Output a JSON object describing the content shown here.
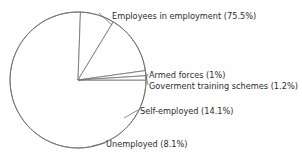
{
  "chart_data": {
    "type": "pie",
    "title": "",
    "subtitle": "",
    "xlabel": "",
    "ylabel": "",
    "legend_position": "none",
    "grid": false,
    "label_format": "{name} ({value}%)",
    "categories": [
      "Employees in employment",
      "Armed forces",
      "Goverment training schemes",
      "Self-employed",
      "Unemployed"
    ],
    "values": [
      75.5,
      1,
      1.2,
      14.1,
      8.1
    ],
    "value_labels": [
      "75.5%",
      "1%",
      "1.2%",
      "14.1%",
      "8.1%"
    ],
    "slices": [
      {
        "name": "Employees in employment",
        "value": 75.5,
        "label": "Employees in employment (75.5%)",
        "fill": "#ffffff",
        "stroke": "#6e6e6e"
      },
      {
        "name": "Armed forces",
        "value": 1,
        "label": "Armed forces (1%)",
        "fill": "#ffffff",
        "stroke": "#6e6e6e"
      },
      {
        "name": "Goverment training schemes",
        "value": 1.2,
        "label": "Goverment training schemes (1.2%)",
        "fill": "#ffffff",
        "stroke": "#6e6e6e"
      },
      {
        "name": "Self-employed",
        "value": 14.1,
        "label": "Self-employed (14.1%)",
        "fill": "#ffffff",
        "stroke": "#6e6e6e"
      },
      {
        "name": "Unemployed",
        "value": 8.1,
        "label": "Unemployed (8.1%)",
        "fill": "#ffffff",
        "stroke": "#6e6e6e"
      }
    ],
    "total": 99.9,
    "geometry": {
      "center_x": 78,
      "center_y": 80,
      "radius": 68,
      "start_angle_deg": 0,
      "direction": "clockwise"
    },
    "style": {
      "background": "#ffffff",
      "stroke": "#6e6e6e",
      "text_color": "#2b2b2b"
    }
  }
}
